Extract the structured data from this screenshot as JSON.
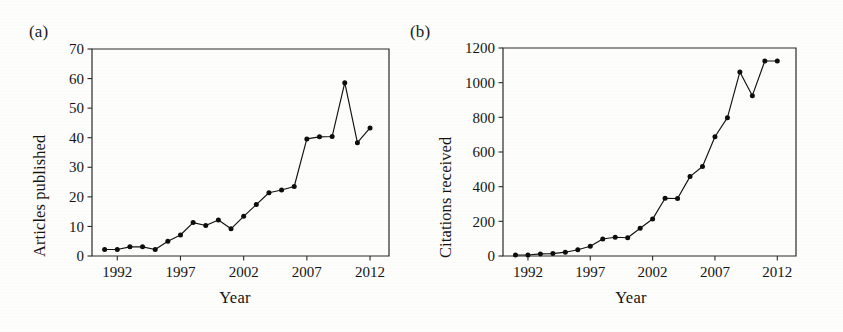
{
  "figure": {
    "background": "#fdfdfc",
    "ink_color": "#111111"
  },
  "panels": {
    "a": {
      "letter": "(a)",
      "ylabel": "Articles published",
      "xlabel": "Year"
    },
    "b": {
      "letter": "(b)",
      "ylabel": "Citations received",
      "xlabel": "Year"
    }
  },
  "chart_data": [
    {
      "panel": "(a)",
      "type": "line",
      "title": "",
      "xlabel": "Year",
      "ylabel": "Articles published",
      "xlim": [
        1990,
        2013.5
      ],
      "ylim": [
        0,
        70
      ],
      "xticks": [
        1992,
        1997,
        2002,
        2007,
        2012
      ],
      "xtick_labels": [
        "1992",
        "1997",
        "2002",
        "2007",
        "2012"
      ],
      "yticks": [
        0,
        10,
        20,
        30,
        40,
        50,
        60,
        70
      ],
      "ytick_labels": [
        "0",
        "10",
        "20",
        "30",
        "40",
        "50",
        "60",
        "70"
      ],
      "grid": false,
      "legend": "none",
      "marker": "filled-circle",
      "x": [
        1991,
        1992,
        1993,
        1994,
        1995,
        1996,
        1997,
        1998,
        1999,
        2000,
        2001,
        2002,
        2003,
        2004,
        2005,
        2006,
        2007,
        2008,
        2009,
        2010,
        2011,
        2012
      ],
      "values": [
        2.2,
        2.2,
        3.1,
        3.1,
        2.2,
        5.0,
        7.1,
        11.3,
        10.3,
        12.2,
        9.2,
        13.4,
        17.4,
        21.4,
        22.3,
        23.5,
        39.6,
        40.3,
        40.4,
        58.6,
        38.3,
        43.3
      ],
      "series": [
        {
          "name": "Articles published",
          "values": [
            2.2,
            2.2,
            3.1,
            3.1,
            2.2,
            5.0,
            7.1,
            11.3,
            10.3,
            12.2,
            9.2,
            13.4,
            17.4,
            21.4,
            22.3,
            23.5,
            39.6,
            40.3,
            40.4,
            58.6,
            38.3,
            43.3
          ]
        }
      ]
    },
    {
      "panel": "(b)",
      "type": "line",
      "title": "",
      "xlabel": "Year",
      "ylabel": "Citations received",
      "xlim": [
        1990,
        2013.5
      ],
      "ylim": [
        0,
        1200
      ],
      "xticks": [
        1992,
        1997,
        2002,
        2007,
        2012
      ],
      "xtick_labels": [
        "1992",
        "1997",
        "2002",
        "2007",
        "2012"
      ],
      "yticks": [
        0,
        200,
        400,
        600,
        800,
        1000,
        1200
      ],
      "ytick_labels": [
        "0",
        "200",
        "400",
        "600",
        "800",
        "1000",
        "1200"
      ],
      "grid": false,
      "legend": "none",
      "marker": "filled-circle",
      "x": [
        1991,
        1992,
        1993,
        1994,
        1995,
        1996,
        1997,
        1998,
        1999,
        2000,
        2001,
        2002,
        2003,
        2004,
        2005,
        2006,
        2007,
        2008,
        2009,
        2010,
        2011,
        2012
      ],
      "values": [
        6,
        6,
        12,
        14,
        22,
        36,
        56,
        98,
        108,
        105,
        160,
        213,
        333,
        332,
        458,
        516,
        688,
        798,
        1062,
        925,
        1125,
        1125
      ],
      "series": [
        {
          "name": "Citations received",
          "values": [
            6,
            6,
            12,
            14,
            22,
            36,
            56,
            98,
            108,
            105,
            160,
            213,
            333,
            332,
            458,
            516,
            688,
            798,
            1062,
            925,
            1125,
            1125
          ]
        }
      ]
    }
  ]
}
